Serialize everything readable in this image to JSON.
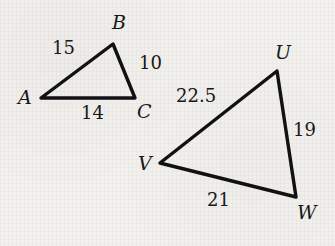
{
  "figure": {
    "background_color": "#f2f1ed",
    "stroke_color": "#111114",
    "label_color": "#17171a",
    "triangles": [
      {
        "name": "triangle-abc",
        "vertices": [
          {
            "id": "A",
            "label": "A",
            "x": 41,
            "y": 98,
            "label_x": 18,
            "label_y": 88
          },
          {
            "id": "B",
            "label": "B",
            "x": 113,
            "y": 44,
            "label_x": 112,
            "label_y": 13
          },
          {
            "id": "C",
            "label": "C",
            "x": 135,
            "y": 98,
            "label_x": 137,
            "label_y": 102
          }
        ],
        "sides": [
          {
            "id": "AB",
            "label": "15",
            "label_x": 52,
            "label_y": 39
          },
          {
            "id": "BC",
            "label": "10",
            "label_x": 139,
            "label_y": 54
          },
          {
            "id": "AC",
            "label": "14",
            "label_x": 81,
            "label_y": 104
          }
        ]
      },
      {
        "name": "triangle-uvw",
        "vertices": [
          {
            "id": "U",
            "label": "U",
            "x": 277,
            "y": 71,
            "label_x": 275,
            "label_y": 43
          },
          {
            "id": "V",
            "label": "V",
            "x": 160,
            "y": 163,
            "label_x": 138,
            "label_y": 154
          },
          {
            "id": "W",
            "label": "W",
            "x": 296,
            "y": 197,
            "label_x": 297,
            "label_y": 203
          }
        ],
        "sides": [
          {
            "id": "VU",
            "label": "22.5",
            "label_x": 176,
            "label_y": 87
          },
          {
            "id": "UW",
            "label": "19",
            "label_x": 293,
            "label_y": 121
          },
          {
            "id": "VW",
            "label": "21",
            "label_x": 207,
            "label_y": 191
          }
        ]
      }
    ]
  },
  "chart_data": {
    "type": "diagram",
    "shapes": [
      {
        "name": "ABC",
        "vertices": [
          "A",
          "B",
          "C"
        ],
        "points": [
          [
            41,
            98
          ],
          [
            113,
            44
          ],
          [
            135,
            98
          ]
        ],
        "side_lengths": {
          "AB": 15,
          "BC": 10,
          "AC": 14
        }
      },
      {
        "name": "UVW",
        "vertices": [
          "U",
          "V",
          "W"
        ],
        "points": [
          [
            277,
            71
          ],
          [
            160,
            163
          ],
          [
            296,
            197
          ]
        ],
        "side_lengths": {
          "VU": 22.5,
          "UW": 19,
          "VW": 21
        }
      }
    ]
  }
}
